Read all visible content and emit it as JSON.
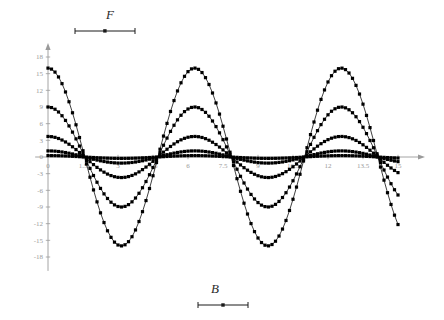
{
  "figure": {
    "background_color": "#ffffff",
    "axis_color": "#9a9a9a",
    "tick_label_color": "#9a9a9a",
    "curve_color": "#000000",
    "marker_color": "#000000",
    "label_color": "#2a2a2a"
  },
  "top_legend": {
    "label": "F",
    "scalebar_name": "scale-bar"
  },
  "bottom_legend": {
    "label": "B",
    "scalebar_name": "scale-bar"
  },
  "chart_data": {
    "type": "line",
    "title": "",
    "subtitle": "",
    "xlabel": "B",
    "ylabel": "F",
    "xlim": [
      -0.55,
      15.9
    ],
    "ylim": [
      -20.5,
      19.6
    ],
    "grid": false,
    "legend_position": "none",
    "x_ticks": [
      0,
      1.5,
      3,
      4.5,
      6,
      7.5,
      9,
      10.5,
      12,
      13.5,
      15
    ],
    "x_tick_labels": [
      "0",
      "1.5",
      "3",
      "4.5",
      "6",
      "7.5",
      "9",
      "10.5",
      "12",
      "13.5",
      "15"
    ],
    "y_ticks": [
      -18,
      -15,
      -12,
      -9,
      -6,
      -3,
      0,
      3,
      6,
      9,
      12,
      15,
      18
    ],
    "y_tick_labels": [
      "-18",
      "-15",
      "-12",
      "-9",
      "-6",
      "-3",
      "0",
      "3",
      "6",
      "9",
      "12",
      "15",
      "18"
    ],
    "x_axis_arrow": true,
    "y_axis_arrow": true,
    "marker": "square",
    "marker_size": 1.6,
    "x_start": 0,
    "x_end": 15,
    "n_points": 101,
    "period": 6.283,
    "series": [
      {
        "name": "amplitude-16",
        "amplitude": 16.0,
        "phase": 0,
        "form": "A*cos(x)"
      },
      {
        "name": "amplitude-9",
        "amplitude": 9.0,
        "phase": 0,
        "form": "A*cos(x)"
      },
      {
        "name": "amplitude-3.7",
        "amplitude": 3.7,
        "phase": 0,
        "form": "A*cos(x)"
      },
      {
        "name": "amplitude-1.1",
        "amplitude": 1.1,
        "phase": 0,
        "form": "A*cos(x)"
      },
      {
        "name": "amplitude-0.25",
        "amplitude": 0.25,
        "phase": 0,
        "form": "A*cos(x)"
      }
    ],
    "annotations": [
      {
        "name": "peak-1",
        "x": 0,
        "y": 16
      },
      {
        "name": "trough-1",
        "x": 3.14,
        "y": -16
      },
      {
        "name": "peak-2",
        "x": 6.28,
        "y": 16
      },
      {
        "name": "trough-2",
        "x": 9.42,
        "y": -16
      },
      {
        "name": "peak-3",
        "x": 12.57,
        "y": 16
      }
    ]
  }
}
